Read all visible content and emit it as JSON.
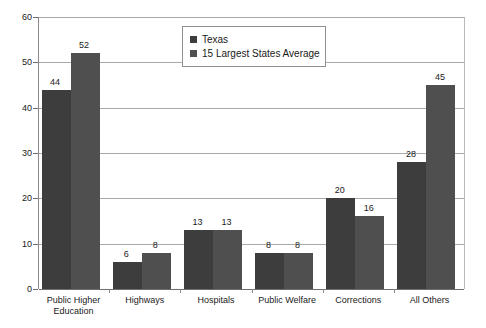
{
  "chart_data": {
    "type": "bar",
    "title": "",
    "subtitle": "",
    "xlabel": "",
    "ylabel": "",
    "ylim": [
      0,
      60
    ],
    "ytick_labels": [
      "0",
      "10",
      "20",
      "30",
      "40",
      "50",
      "60"
    ],
    "yticks": [
      0,
      10,
      20,
      30,
      40,
      50,
      60
    ],
    "grid": true,
    "legend_position": "top-center",
    "categories": [
      "Public Higher\nEducation",
      "Highways",
      "Hospitals",
      "Public Welfare",
      "Corrections",
      "All Others"
    ],
    "series": [
      {
        "name": "Texas",
        "color": "#3d3d3d",
        "values": [
          44,
          6,
          13,
          8,
          20,
          28
        ],
        "value_labels": [
          "44",
          "6",
          "13",
          "8",
          "20",
          "28"
        ]
      },
      {
        "name": "15 Largest States Average",
        "color": "#4f4f4f",
        "values": [
          52,
          8,
          13,
          8,
          16,
          45
        ],
        "value_labels": [
          "52",
          "8",
          "13",
          "8",
          "16",
          "45"
        ]
      }
    ]
  },
  "legend": {
    "items": [
      {
        "label": "Texas",
        "swatch_icon": "legend-swatch-icon"
      },
      {
        "label": "15 Largest States Average",
        "swatch_icon": "legend-swatch-icon"
      }
    ]
  }
}
